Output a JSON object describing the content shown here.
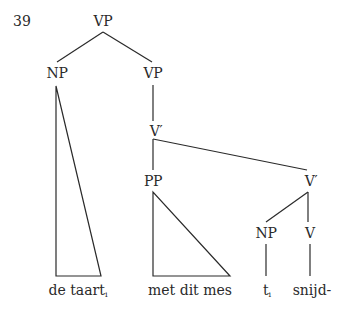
{
  "example": {
    "number": "39"
  },
  "tree": {
    "root": {
      "label": "VP"
    },
    "np_subject": {
      "label": "NP"
    },
    "vp_inner": {
      "label": "VP"
    },
    "vbar_upper": {
      "label": "V′"
    },
    "pp": {
      "label": "PP"
    },
    "vbar_lower": {
      "label": "V′"
    },
    "np_trace": {
      "label": "NP"
    },
    "v_head": {
      "label": "V"
    }
  },
  "leaves": [
    {
      "text": "de taart",
      "subscript": "i"
    },
    {
      "text": "met dit mes",
      "subscript": ""
    },
    {
      "text": "t",
      "subscript": "i"
    },
    {
      "text": "snijd-",
      "subscript": ""
    }
  ],
  "colors": {
    "line": "#2a2a2a",
    "background": "#ffffff"
  }
}
